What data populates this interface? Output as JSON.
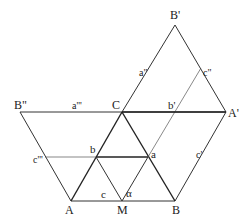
{
  "diagram": {
    "points": {
      "A": [
        71,
        201
      ],
      "M": [
        122,
        201
      ],
      "B": [
        175,
        201
      ],
      "b": [
        96,
        157
      ],
      "a": [
        148,
        157
      ],
      "C": [
        122,
        112
      ],
      "A1": [
        226,
        112
      ],
      "B2": [
        20,
        112
      ],
      "B1": [
        175,
        25
      ],
      "b1": [
        175,
        112
      ],
      "c2": [
        201,
        68
      ],
      "c3": [
        45,
        157
      ]
    },
    "labels": {
      "B1": "B'",
      "c2": "c\"",
      "a2": "a\"",
      "B2": "B\"",
      "a3": "a'''",
      "C": "C",
      "b1": "b'",
      "A1": "A'",
      "c3": "c'''",
      "b": "b",
      "a": "a",
      "c1": "c'",
      "A": "A",
      "c": "c",
      "M": "M",
      "alpha": "α",
      "B": "B"
    }
  }
}
